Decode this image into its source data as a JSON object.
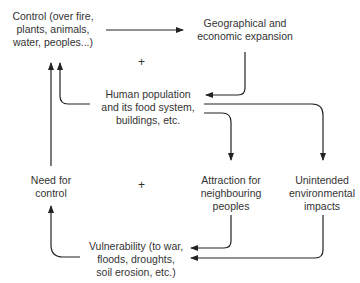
{
  "diagram": {
    "nodes": {
      "control": "Control (over fire, plants, animals, water, peoples...)",
      "expansion": "Geographical and economic expansion",
      "population": "Human population and its food system, buildings, etc.",
      "need": "Need for control",
      "attraction": "Attraction for neighbouring peoples",
      "impacts": "Unintended environmental impacts",
      "vulnerability": "Vulnerability (to war, floods, droughts, soil erosion, etc.)"
    },
    "lines": {
      "control": [
        "Control (over fire,",
        "plants, animals,",
        "water, peoples...)"
      ],
      "expansion": [
        "Geographical and",
        "economic expansion"
      ],
      "population": [
        "Human population",
        "and its food system,",
        "buildings, etc."
      ],
      "need": [
        "Need for",
        "control"
      ],
      "attraction": [
        "Attraction for",
        "neighbouring",
        "peoples"
      ],
      "impacts": [
        "Unintended",
        "environmental",
        "impacts"
      ],
      "vulnerability": [
        "Vulnerability (to war,",
        "floods, droughts,",
        "soil erosion, etc.)"
      ]
    },
    "loop_signs": [
      "+",
      "+"
    ],
    "edges": [
      {
        "from": "control",
        "to": "expansion"
      },
      {
        "from": "expansion",
        "to": "population"
      },
      {
        "from": "population",
        "to": "control"
      },
      {
        "from": "population",
        "to": "attraction"
      },
      {
        "from": "population",
        "to": "impacts"
      },
      {
        "from": "attraction",
        "to": "vulnerability"
      },
      {
        "from": "impacts",
        "to": "vulnerability"
      },
      {
        "from": "vulnerability",
        "to": "need"
      },
      {
        "from": "need",
        "to": "control"
      }
    ],
    "colors": {
      "line": "#222222",
      "text": "#333333"
    }
  }
}
